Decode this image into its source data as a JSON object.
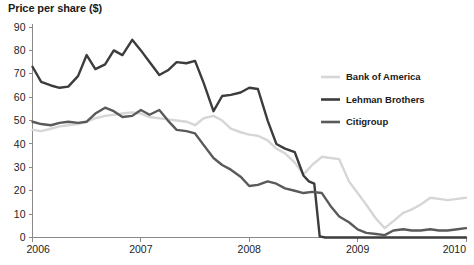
{
  "chart_data": {
    "type": "line",
    "title": "Price per share ($)",
    "xlabel": "",
    "ylabel": "Price per share ($)",
    "xlim": [
      2006,
      2010
    ],
    "ylim": [
      0,
      90
    ],
    "ytick_step": 10,
    "grid": false,
    "legend_position": "right-upper",
    "x_tick_labels": [
      "2006",
      "2007",
      "2008",
      "2009",
      "2010"
    ],
    "x_tick_values": [
      2006,
      2007,
      2008,
      2009,
      2010
    ],
    "y_tick_labels": [
      "0",
      "10",
      "20",
      "30",
      "40",
      "50",
      "60",
      "70",
      "80",
      "90"
    ],
    "y_tick_values": [
      0,
      10,
      20,
      30,
      40,
      50,
      60,
      70,
      80,
      90
    ],
    "colors": {
      "bank_of_america": "#d6d6d6",
      "lehman_brothers": "#3c3c3c",
      "citigroup": "#5a5a5a",
      "axis": "#8a8a8a",
      "text": "#1a1a1a",
      "background": "#ffffff"
    },
    "series": [
      {
        "name": "Bank of America",
        "color": "#d6d6d6",
        "x": [
          2006.0,
          2006.08,
          2006.17,
          2006.25,
          2006.33,
          2006.42,
          2006.5,
          2006.58,
          2006.67,
          2006.75,
          2006.83,
          2006.92,
          2007.0,
          2007.08,
          2007.17,
          2007.25,
          2007.33,
          2007.42,
          2007.5,
          2007.58,
          2007.67,
          2007.75,
          2007.83,
          2007.92,
          2008.0,
          2008.08,
          2008.17,
          2008.25,
          2008.33,
          2008.42,
          2008.5,
          2008.58,
          2008.67,
          2008.75,
          2008.83,
          2008.92,
          2009.0,
          2009.08,
          2009.17,
          2009.25,
          2009.33,
          2009.42,
          2009.5,
          2009.58,
          2009.67,
          2009.75,
          2009.83,
          2009.92,
          2010.0
        ],
        "values": [
          46.0,
          45.5,
          46.5,
          47.5,
          48.0,
          48.5,
          49.5,
          51.0,
          52.0,
          52.5,
          53.0,
          53.5,
          53.0,
          51.5,
          51.0,
          50.5,
          50.0,
          49.5,
          48.0,
          51.0,
          52.0,
          50.0,
          46.5,
          45.0,
          44.0,
          43.5,
          41.5,
          38.0,
          36.0,
          32.0,
          27.0,
          31.0,
          34.5,
          34.0,
          33.5,
          24.0,
          19.0,
          14.0,
          8.0,
          4.0,
          7.0,
          10.5,
          12.0,
          14.0,
          17.0,
          16.5,
          16.0,
          16.5,
          17.0
        ]
      },
      {
        "name": "Lehman Brothers",
        "color": "#3c3c3c",
        "x": [
          2006.0,
          2006.08,
          2006.17,
          2006.25,
          2006.33,
          2006.42,
          2006.5,
          2006.58,
          2006.67,
          2006.75,
          2006.83,
          2006.92,
          2007.0,
          2007.08,
          2007.17,
          2007.25,
          2007.33,
          2007.42,
          2007.5,
          2007.58,
          2007.67,
          2007.75,
          2007.83,
          2007.92,
          2008.0,
          2008.08,
          2008.17,
          2008.25,
          2008.33,
          2008.42,
          2008.5,
          2008.55,
          2008.6,
          2008.65,
          2008.7,
          2009.0,
          2009.25,
          2009.5,
          2009.75,
          2010.0
        ],
        "values": [
          73.0,
          66.5,
          65.0,
          64.0,
          64.5,
          69.0,
          78.0,
          72.0,
          74.0,
          80.0,
          78.0,
          84.5,
          80.0,
          75.0,
          69.5,
          71.5,
          75.0,
          74.5,
          75.5,
          66.0,
          54.0,
          60.5,
          61.0,
          62.0,
          64.0,
          63.5,
          50.0,
          40.0,
          38.0,
          36.5,
          26.5,
          24.0,
          23.0,
          0.5,
          0.0,
          0.0,
          0.0,
          0.0,
          0.0,
          0.0
        ]
      },
      {
        "name": "Citigroup",
        "color": "#5a5a5a",
        "x": [
          2006.0,
          2006.08,
          2006.17,
          2006.25,
          2006.33,
          2006.42,
          2006.5,
          2006.58,
          2006.67,
          2006.75,
          2006.83,
          2006.92,
          2007.0,
          2007.08,
          2007.17,
          2007.25,
          2007.33,
          2007.42,
          2007.5,
          2007.58,
          2007.67,
          2007.75,
          2007.83,
          2007.92,
          2008.0,
          2008.08,
          2008.17,
          2008.25,
          2008.33,
          2008.42,
          2008.5,
          2008.58,
          2008.67,
          2008.75,
          2008.83,
          2008.92,
          2009.0,
          2009.08,
          2009.17,
          2009.25,
          2009.33,
          2009.42,
          2009.5,
          2009.58,
          2009.67,
          2009.75,
          2009.83,
          2009.92,
          2010.0
        ],
        "values": [
          49.5,
          48.5,
          48.0,
          49.0,
          49.5,
          49.0,
          49.5,
          53.0,
          55.5,
          54.0,
          51.5,
          52.0,
          54.5,
          52.5,
          54.5,
          50.0,
          46.0,
          45.5,
          44.5,
          39.5,
          34.0,
          31.0,
          29.0,
          26.0,
          22.0,
          22.5,
          24.0,
          23.0,
          21.0,
          20.0,
          19.0,
          19.5,
          19.0,
          13.5,
          9.0,
          6.5,
          3.5,
          2.0,
          1.5,
          1.0,
          3.0,
          3.5,
          3.0,
          3.0,
          3.5,
          3.0,
          3.0,
          3.5,
          4.0
        ]
      }
    ]
  },
  "legend": {
    "items": [
      {
        "label": "Bank of America",
        "color": "#d6d6d6"
      },
      {
        "label": "Lehman Brothers",
        "color": "#3c3c3c"
      },
      {
        "label": "Citigroup",
        "color": "#5a5a5a"
      }
    ]
  }
}
